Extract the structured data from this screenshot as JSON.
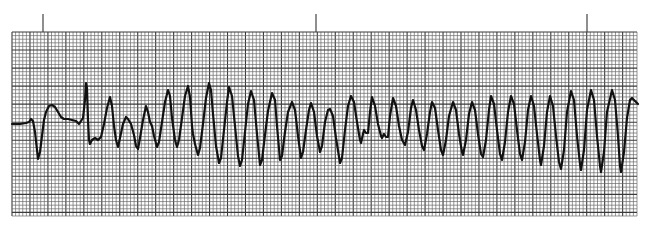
{
  "title": "ECG rhythm strip",
  "chart_data": {
    "type": "line",
    "title": "",
    "xlabel": "",
    "ylabel": "",
    "grid": true,
    "paper": {
      "left": 12,
      "top": 32,
      "right": 637,
      "bottom": 216,
      "major_spacing": 18.0,
      "minor_spacing": 3.6,
      "grid_color": "#3a3a3a",
      "minor_color": "#6a6a6a",
      "background": "#ffffff"
    },
    "time_markers_x": [
      43,
      316,
      587
    ],
    "marker_top": 14,
    "trace_color": "#111111",
    "trace_width": 2.2,
    "points": [
      [
        12,
        124
      ],
      [
        20,
        124
      ],
      [
        26,
        123
      ],
      [
        29,
        122
      ],
      [
        31,
        119
      ],
      [
        33,
        121
      ],
      [
        35,
        132
      ],
      [
        37,
        150
      ],
      [
        38,
        159
      ],
      [
        40,
        152
      ],
      [
        42,
        136
      ],
      [
        44,
        120
      ],
      [
        46,
        112
      ],
      [
        49,
        106
      ],
      [
        52,
        105
      ],
      [
        55,
        107
      ],
      [
        58,
        112
      ],
      [
        61,
        117
      ],
      [
        64,
        119
      ],
      [
        68,
        119
      ],
      [
        72,
        120
      ],
      [
        76,
        121
      ],
      [
        79,
        124
      ],
      [
        81,
        121
      ],
      [
        83,
        118
      ],
      [
        85,
        100
      ],
      [
        86,
        83
      ],
      [
        87,
        88
      ],
      [
        88,
        120
      ],
      [
        89,
        140
      ],
      [
        90,
        144
      ],
      [
        92,
        140
      ],
      [
        95,
        138
      ],
      [
        98,
        140
      ],
      [
        101,
        137
      ],
      [
        104,
        124
      ],
      [
        107,
        108
      ],
      [
        110,
        97
      ],
      [
        112,
        106
      ],
      [
        114,
        126
      ],
      [
        116,
        140
      ],
      [
        118,
        147
      ],
      [
        120,
        138
      ],
      [
        123,
        124
      ],
      [
        126,
        117
      ],
      [
        128,
        119
      ],
      [
        131,
        124
      ],
      [
        134,
        135
      ],
      [
        136,
        146
      ],
      [
        138,
        149
      ],
      [
        140,
        138
      ],
      [
        143,
        120
      ],
      [
        146,
        106
      ],
      [
        148,
        112
      ],
      [
        150,
        122
      ],
      [
        152,
        126
      ],
      [
        154,
        136
      ],
      [
        157,
        147
      ],
      [
        159,
        142
      ],
      [
        162,
        122
      ],
      [
        165,
        102
      ],
      [
        168,
        90
      ],
      [
        170,
        96
      ],
      [
        172,
        118
      ],
      [
        175,
        140
      ],
      [
        177,
        147
      ],
      [
        179,
        140
      ],
      [
        182,
        118
      ],
      [
        185,
        96
      ],
      [
        188,
        86
      ],
      [
        190,
        97
      ],
      [
        192,
        126
      ],
      [
        193,
        134
      ],
      [
        195,
        144
      ],
      [
        198,
        155
      ],
      [
        200,
        148
      ],
      [
        203,
        124
      ],
      [
        206,
        98
      ],
      [
        209,
        83
      ],
      [
        211,
        90
      ],
      [
        213,
        114
      ],
      [
        216,
        146
      ],
      [
        219,
        163
      ],
      [
        221,
        158
      ],
      [
        224,
        130
      ],
      [
        227,
        102
      ],
      [
        229,
        87
      ],
      [
        232,
        96
      ],
      [
        235,
        126
      ],
      [
        238,
        156
      ],
      [
        240,
        166
      ],
      [
        242,
        160
      ],
      [
        245,
        132
      ],
      [
        248,
        104
      ],
      [
        251,
        91
      ],
      [
        254,
        100
      ],
      [
        257,
        134
      ],
      [
        260,
        165
      ],
      [
        262,
        160
      ],
      [
        265,
        135
      ],
      [
        268,
        111
      ],
      [
        270,
        102
      ],
      [
        272,
        93
      ],
      [
        275,
        100
      ],
      [
        277,
        126
      ],
      [
        280,
        160
      ],
      [
        282,
        156
      ],
      [
        285,
        132
      ],
      [
        288,
        112
      ],
      [
        292,
        102
      ],
      [
        295,
        110
      ],
      [
        298,
        136
      ],
      [
        301,
        158
      ],
      [
        303,
        152
      ],
      [
        306,
        130
      ],
      [
        309,
        110
      ],
      [
        311,
        103
      ],
      [
        314,
        112
      ],
      [
        317,
        136
      ],
      [
        320,
        152
      ],
      [
        322,
        146
      ],
      [
        325,
        122
      ],
      [
        328,
        110
      ],
      [
        330,
        109
      ],
      [
        333,
        116
      ],
      [
        336,
        138
      ],
      [
        340,
        163
      ],
      [
        342,
        158
      ],
      [
        345,
        130
      ],
      [
        348,
        106
      ],
      [
        351,
        96
      ],
      [
        354,
        102
      ],
      [
        357,
        122
      ],
      [
        360,
        140
      ],
      [
        361,
        143
      ],
      [
        363,
        134
      ],
      [
        364,
        130
      ],
      [
        366,
        133
      ],
      [
        368,
        133
      ],
      [
        370,
        112
      ],
      [
        372,
        97
      ],
      [
        375,
        106
      ],
      [
        378,
        124
      ],
      [
        381,
        136
      ],
      [
        382,
        138
      ],
      [
        384,
        134
      ],
      [
        386,
        137
      ],
      [
        388,
        137
      ],
      [
        390,
        116
      ],
      [
        393,
        98
      ],
      [
        396,
        106
      ],
      [
        399,
        126
      ],
      [
        402,
        140
      ],
      [
        405,
        145
      ],
      [
        408,
        132
      ],
      [
        411,
        108
      ],
      [
        413,
        100
      ],
      [
        416,
        110
      ],
      [
        419,
        130
      ],
      [
        422,
        146
      ],
      [
        424,
        150
      ],
      [
        427,
        134
      ],
      [
        430,
        112
      ],
      [
        432,
        102
      ],
      [
        435,
        108
      ],
      [
        438,
        130
      ],
      [
        441,
        150
      ],
      [
        443,
        155
      ],
      [
        446,
        140
      ],
      [
        449,
        116
      ],
      [
        453,
        102
      ],
      [
        456,
        110
      ],
      [
        459,
        134
      ],
      [
        462,
        152
      ],
      [
        463,
        155
      ],
      [
        466,
        140
      ],
      [
        469,
        114
      ],
      [
        472,
        102
      ],
      [
        475,
        110
      ],
      [
        478,
        134
      ],
      [
        481,
        154
      ],
      [
        483,
        157
      ],
      [
        486,
        140
      ],
      [
        489,
        110
      ],
      [
        491,
        96
      ],
      [
        494,
        104
      ],
      [
        497,
        130
      ],
      [
        500,
        154
      ],
      [
        502,
        160
      ],
      [
        505,
        142
      ],
      [
        508,
        112
      ],
      [
        511,
        96
      ],
      [
        514,
        104
      ],
      [
        517,
        130
      ],
      [
        520,
        154
      ],
      [
        522,
        160
      ],
      [
        525,
        142
      ],
      [
        528,
        110
      ],
      [
        531,
        96
      ],
      [
        534,
        106
      ],
      [
        537,
        134
      ],
      [
        540,
        160
      ],
      [
        541,
        165
      ],
      [
        544,
        146
      ],
      [
        547,
        112
      ],
      [
        550,
        96
      ],
      [
        553,
        106
      ],
      [
        556,
        136
      ],
      [
        559,
        162
      ],
      [
        561,
        169
      ],
      [
        564,
        150
      ],
      [
        567,
        112
      ],
      [
        571,
        91
      ],
      [
        574,
        100
      ],
      [
        577,
        136
      ],
      [
        580,
        164
      ],
      [
        581,
        170
      ],
      [
        584,
        150
      ],
      [
        587,
        110
      ],
      [
        591,
        90
      ],
      [
        594,
        100
      ],
      [
        597,
        136
      ],
      [
        600,
        166
      ],
      [
        601,
        172
      ],
      [
        604,
        152
      ],
      [
        607,
        112
      ],
      [
        612,
        90
      ],
      [
        615,
        100
      ],
      [
        618,
        136
      ],
      [
        620,
        166
      ],
      [
        621,
        172
      ],
      [
        624,
        152
      ],
      [
        627,
        118
      ],
      [
        630,
        100
      ],
      [
        632,
        98
      ],
      [
        635,
        101
      ],
      [
        638,
        104
      ]
    ]
  }
}
